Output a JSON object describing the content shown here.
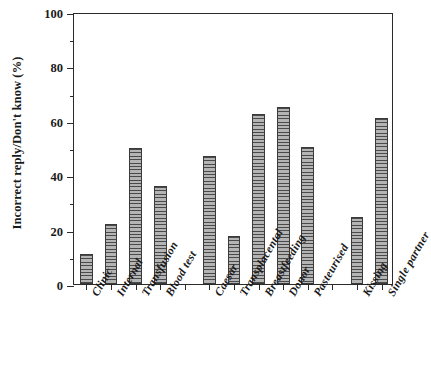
{
  "chart_data": {
    "type": "bar",
    "title": "",
    "xlabel": "",
    "ylabel": "Incorrect reply/Don't know (%)",
    "ylim": [
      0,
      100
    ],
    "ytick_labels": [
      "0",
      "20",
      "40",
      "60",
      "80",
      "100"
    ],
    "ytick_values": [
      0,
      20,
      40,
      60,
      80,
      100
    ],
    "yminor_values": [
      10,
      30,
      50,
      70,
      90
    ],
    "grid": false,
    "legend": null,
    "categories": [
      "Clinic",
      "Internal",
      "Transfusion",
      "Blood test",
      "Caesar",
      "Transplacental",
      "Breastfeeding",
      "Donor",
      "Pasteurised",
      "Kissing",
      "Single partner"
    ],
    "values": [
      11,
      22,
      50,
      36,
      47,
      17.5,
      62.5,
      65,
      50.5,
      24.5,
      61
    ],
    "groups": [
      {
        "name": "group-1",
        "categories": [
          "Clinic",
          "Internal",
          "Transfusion",
          "Blood test"
        ]
      },
      {
        "name": "group-2",
        "categories": [
          "Caesar",
          "Transplacental",
          "Breastfeeding",
          "Donor",
          "Pasteurised"
        ]
      },
      {
        "name": "group-3",
        "categories": [
          "Kissing",
          "Single partner"
        ]
      }
    ],
    "bar_style": {
      "fill": "#b4b4b4",
      "hatch": "horizontal-lines",
      "hatch_color": "#4a4a4a",
      "edge_color": "#3a3a3a"
    }
  },
  "axis": {
    "frame_color": "#2b2b2b"
  }
}
